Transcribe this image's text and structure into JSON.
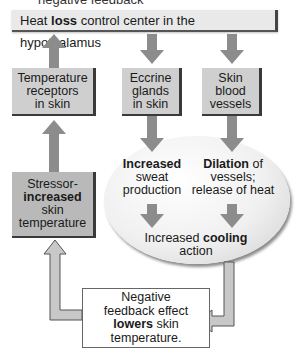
{
  "title_fragment": "negative feedback",
  "header": {
    "pre": "Heat ",
    "bold": "loss",
    "post": " control center in the hypothalamus"
  },
  "boxes": {
    "receptors": [
      "Temperature",
      "receptors",
      "in skin"
    ],
    "eccrine": [
      "Eccrine",
      "glands",
      "in skin"
    ],
    "vessels": [
      "Skin",
      "blood",
      "vessels"
    ],
    "stressor": {
      "line1": "Stressor-",
      "bold": "increased",
      "line3": "skin",
      "line4": "temperature"
    }
  },
  "ellipse": {
    "sweat": {
      "bold": "Increased",
      "line2": "sweat",
      "line3": "production"
    },
    "dilation": {
      "bold": "Dilation",
      "rest": " of",
      "line2": "vessels;",
      "line3": "release of heat"
    },
    "cooling": {
      "pre": "Increased ",
      "bold": "cooling",
      "line2": "action"
    }
  },
  "feedback": {
    "line1": "Negative",
    "line2": "feedback effect",
    "bold": "lowers",
    "rest": " skin",
    "line4": "temperature."
  },
  "colors": {
    "arrow_fill": "#8c8c8c",
    "arrow_outline_fill": "#c8c8c8",
    "box_fill": "#cfcfcf",
    "stressor_fill": "#b9b9b9"
  }
}
